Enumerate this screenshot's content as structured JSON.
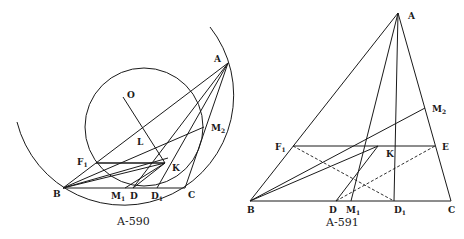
{
  "figures": [
    {
      "caption": "A-590",
      "points": {
        "A": {
          "label": "A",
          "x": 228,
          "y": 63
        },
        "O": {
          "label": "O",
          "x": 123,
          "y": 97
        },
        "L": {
          "label": "L",
          "x": 143,
          "y": 138
        },
        "M2": {
          "label": "M",
          "sub": "2",
          "x": 204,
          "y": 127
        },
        "F1": {
          "label": "F",
          "sub": "1",
          "x": 96,
          "y": 163
        },
        "K": {
          "label": "K",
          "x": 165,
          "y": 163
        },
        "B": {
          "label": "B",
          "x": 63,
          "y": 188
        },
        "M1": {
          "label": "M",
          "sub": "1",
          "x": 125,
          "y": 188
        },
        "D": {
          "label": "D",
          "x": 133,
          "y": 188
        },
        "D1": {
          "label": "D",
          "sub": "1",
          "x": 157,
          "y": 188
        },
        "C": {
          "label": "C",
          "x": 185,
          "y": 188
        }
      },
      "circles": [
        {
          "name": "incircle",
          "cx": 144,
          "cy": 127,
          "r": 59
        },
        {
          "name": "circumcircle-arc",
          "cx": 125,
          "cy": 96,
          "r": 110
        }
      ]
    },
    {
      "caption": "A-591",
      "points": {
        "A": {
          "label": "A",
          "x": 398,
          "y": 13
        },
        "M2": {
          "label": "M",
          "sub": "2",
          "x": 425,
          "y": 108
        },
        "F1": {
          "label": "F",
          "sub": "1",
          "x": 293,
          "y": 146
        },
        "K": {
          "label": "K",
          "x": 378,
          "y": 146
        },
        "E": {
          "label": "E",
          "x": 435,
          "y": 146
        },
        "B": {
          "label": "B",
          "x": 250,
          "y": 201
        },
        "D": {
          "label": "D",
          "x": 336,
          "y": 201
        },
        "M1": {
          "label": "M",
          "sub": "1",
          "x": 351,
          "y": 201
        },
        "D1": {
          "label": "D",
          "sub": "1",
          "x": 394,
          "y": 201
        },
        "C": {
          "label": "C",
          "x": 451,
          "y": 201
        }
      }
    }
  ]
}
